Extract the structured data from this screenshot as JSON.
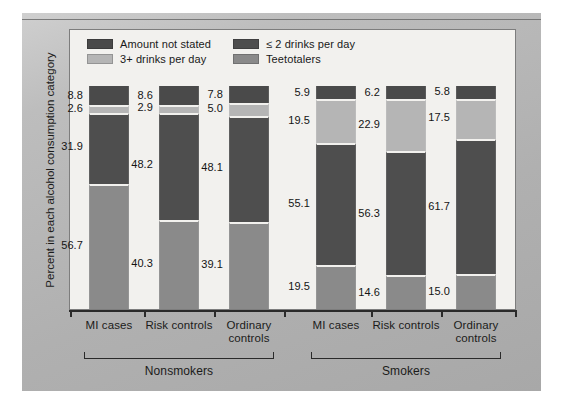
{
  "chart_data": {
    "type": "bar",
    "subtype": "stacked-bar-100",
    "title": "",
    "xlabel": "",
    "ylabel": "Percent in each alcohol consumption category",
    "ylim": [
      0,
      100
    ],
    "grid": false,
    "legend_position": "top-left",
    "orientation": "vertical",
    "stack_order_top_to_bottom": [
      "Amount not stated",
      "3+ drinks per day",
      "≤ 2 drinks per day",
      "Teetotalers"
    ],
    "categories": [
      "MI cases",
      "Risk controls",
      "Ordinary controls",
      "MI cases",
      "Risk controls",
      "Ordinary controls"
    ],
    "groups": [
      {
        "name": "Nonsmokers",
        "categories": [
          "MI cases",
          "Risk controls",
          "Ordinary controls"
        ]
      },
      {
        "name": "Smokers",
        "categories": [
          "MI cases",
          "Risk controls",
          "Ordinary controls"
        ]
      }
    ],
    "series": [
      {
        "name": "Amount not stated",
        "color": "#4a4a4a",
        "values": [
          8.8,
          8.6,
          7.8,
          5.9,
          6.2,
          5.8
        ]
      },
      {
        "name": "3+ drinks per day",
        "color": "#b5b5b5",
        "values": [
          2.6,
          2.9,
          5.0,
          19.5,
          22.9,
          17.5
        ]
      },
      {
        "name": "≤ 2 drinks per day",
        "color": "#4e4e4e",
        "values": [
          31.9,
          48.2,
          48.1,
          55.1,
          56.3,
          61.7
        ]
      },
      {
        "name": "Teetotalers",
        "color": "#8a8a8a",
        "values": [
          56.7,
          40.3,
          39.1,
          19.5,
          14.6,
          15.0
        ]
      }
    ]
  },
  "legend": {
    "items": [
      {
        "label": "Amount not stated",
        "color": "#4a4a4a"
      },
      {
        "label": "≤ 2 drinks per day",
        "color": "#4e4e4e"
      },
      {
        "label": "3+ drinks per day",
        "color": "#b5b5b5"
      },
      {
        "label": "Teetotalers",
        "color": "#8a8a8a"
      }
    ]
  },
  "axis": {
    "y_title": "Percent in each alcohol consumption category",
    "category_labels": [
      {
        "line1": "MI cases",
        "line2": ""
      },
      {
        "line1": "Risk controls",
        "line2": ""
      },
      {
        "line1": "Ordinary",
        "line2": "controls"
      },
      {
        "line1": "MI cases",
        "line2": ""
      },
      {
        "line1": "Risk controls",
        "line2": ""
      },
      {
        "line1": "Ordinary",
        "line2": "controls"
      }
    ],
    "group_labels": [
      "Nonsmokers",
      "Smokers"
    ]
  },
  "value_labels": {
    "bar0": {
      "amount_not_stated": "8.8",
      "three_plus": "2.6",
      "two_or_less": "31.9",
      "teetotalers": "56.7"
    },
    "bar1": {
      "amount_not_stated": "8.6",
      "three_plus": "2.9",
      "two_or_less": "48.2",
      "teetotalers": "40.3"
    },
    "bar2": {
      "amount_not_stated": "7.8",
      "three_plus": "5.0",
      "two_or_less": "48.1",
      "teetotalers": "39.1"
    },
    "bar3": {
      "amount_not_stated": "5.9",
      "three_plus": "19.5",
      "two_or_less": "55.1",
      "teetotalers": "19.5"
    },
    "bar4": {
      "amount_not_stated": "6.2",
      "three_plus": "22.9",
      "two_or_less": "56.3",
      "teetotalers": "14.6"
    },
    "bar5": {
      "amount_not_stated": "5.8",
      "three_plus": "17.5",
      "two_or_less": "61.7",
      "teetotalers": "15.0"
    }
  },
  "colors": {
    "frame": "#b2b2b2",
    "panel": "#f2f1ee",
    "axis": "#2a2a2a",
    "text": "#1b1b1a"
  }
}
